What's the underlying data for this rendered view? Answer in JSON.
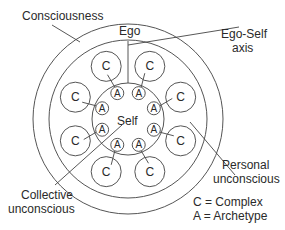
{
  "diagram": {
    "layers": {
      "consciousness": "Consciousness",
      "ego": "Ego",
      "ego_self_axis_line1": "Ego-Self",
      "ego_self_axis_line2": "axis",
      "self": "Self",
      "personal_unconscious_line1": "Personal",
      "personal_unconscious_line2": "unconscious",
      "collective_unconscious_line1": "Collective",
      "collective_unconscious_line2": "unconscious"
    },
    "complex_symbol": "C",
    "archetype_symbol": "A",
    "complex_count": 8,
    "archetype_count": 8,
    "legend": {
      "complex": "C = Complex",
      "archetype": "A = Archetype"
    }
  }
}
